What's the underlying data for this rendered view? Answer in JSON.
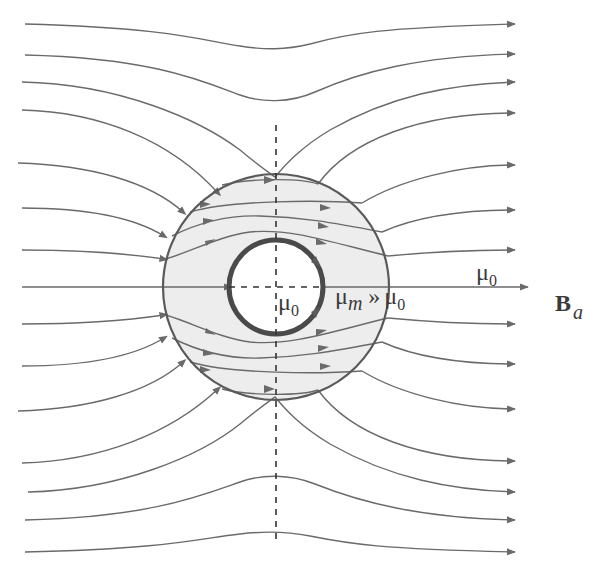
{
  "diagram": {
    "colors": {
      "background": "#ffffff",
      "line": "#6a6a6a",
      "shell_fill": "#ececec",
      "shell_stroke": "#5a5a5a",
      "cavity_stroke": "#4a4a4a",
      "text": "#3a3a3a"
    },
    "geometry": {
      "center": [
        276,
        287
      ],
      "outer_radius": 113,
      "inner_radius": 47
    },
    "labels": {
      "cavity_mu": {
        "symbol": "μ",
        "sub": "0"
      },
      "shell_relation": {
        "left_symbol": "μ",
        "left_sub": "m",
        "relation": "»",
        "right_symbol": "μ",
        "right_sub": "0"
      },
      "outside_mu": {
        "symbol": "μ",
        "sub": "0"
      },
      "field": {
        "symbol": "B",
        "sub": "a"
      }
    },
    "elements": [
      "uniform applied field lines (left to right)",
      "high-permeability spherical shell (annulus)",
      "shielded inner cavity",
      "dashed symmetry axes"
    ]
  }
}
